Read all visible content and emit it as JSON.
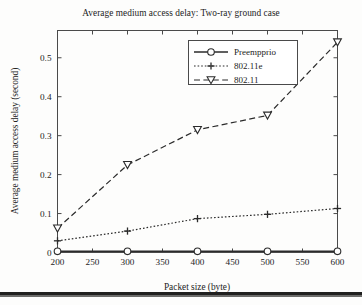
{
  "chart_data": {
    "type": "line",
    "title": "Average medium access delay: Two-ray ground case",
    "xlabel": "Packet size (byte)",
    "ylabel": "Average medium access delay (second)",
    "x": [
      200,
      300,
      400,
      500,
      600
    ],
    "xlim": [
      200,
      600
    ],
    "ylim": [
      0,
      0.57
    ],
    "xticks": [
      200,
      250,
      300,
      350,
      400,
      450,
      500,
      550,
      600
    ],
    "xtick_labels": [
      "200",
      "250",
      "300",
      "350",
      "400",
      "450",
      "500",
      "550",
      "600"
    ],
    "yticks": [
      0,
      0.1,
      0.2,
      0.3,
      0.4,
      0.5
    ],
    "ytick_labels": [
      "0",
      "0.1",
      "0.2",
      "0.3",
      "0.4",
      "0.5"
    ],
    "grid": false,
    "legend_position": "top-center",
    "series": [
      {
        "name": "Preempprio",
        "values": [
          0.003,
          0.003,
          0.003,
          0.003,
          0.003
        ],
        "line_style": "solid",
        "marker": "circle",
        "color": "#2b2b2b"
      },
      {
        "name": "802.11e",
        "values": [
          0.03,
          0.055,
          0.087,
          0.098,
          0.113
        ],
        "line_style": "dotted",
        "marker": "plus",
        "color": "#2b2b2b"
      },
      {
        "name": "802.11",
        "values": [
          0.062,
          0.225,
          0.315,
          0.352,
          0.54
        ],
        "line_style": "dashed",
        "marker": "triangle-down",
        "color": "#2b2b2b"
      }
    ]
  },
  "figure": {
    "background": "#fdfdfc",
    "axis_color": "#4a4a4a",
    "text_color": "#232323",
    "rule_color": "#20201f"
  }
}
